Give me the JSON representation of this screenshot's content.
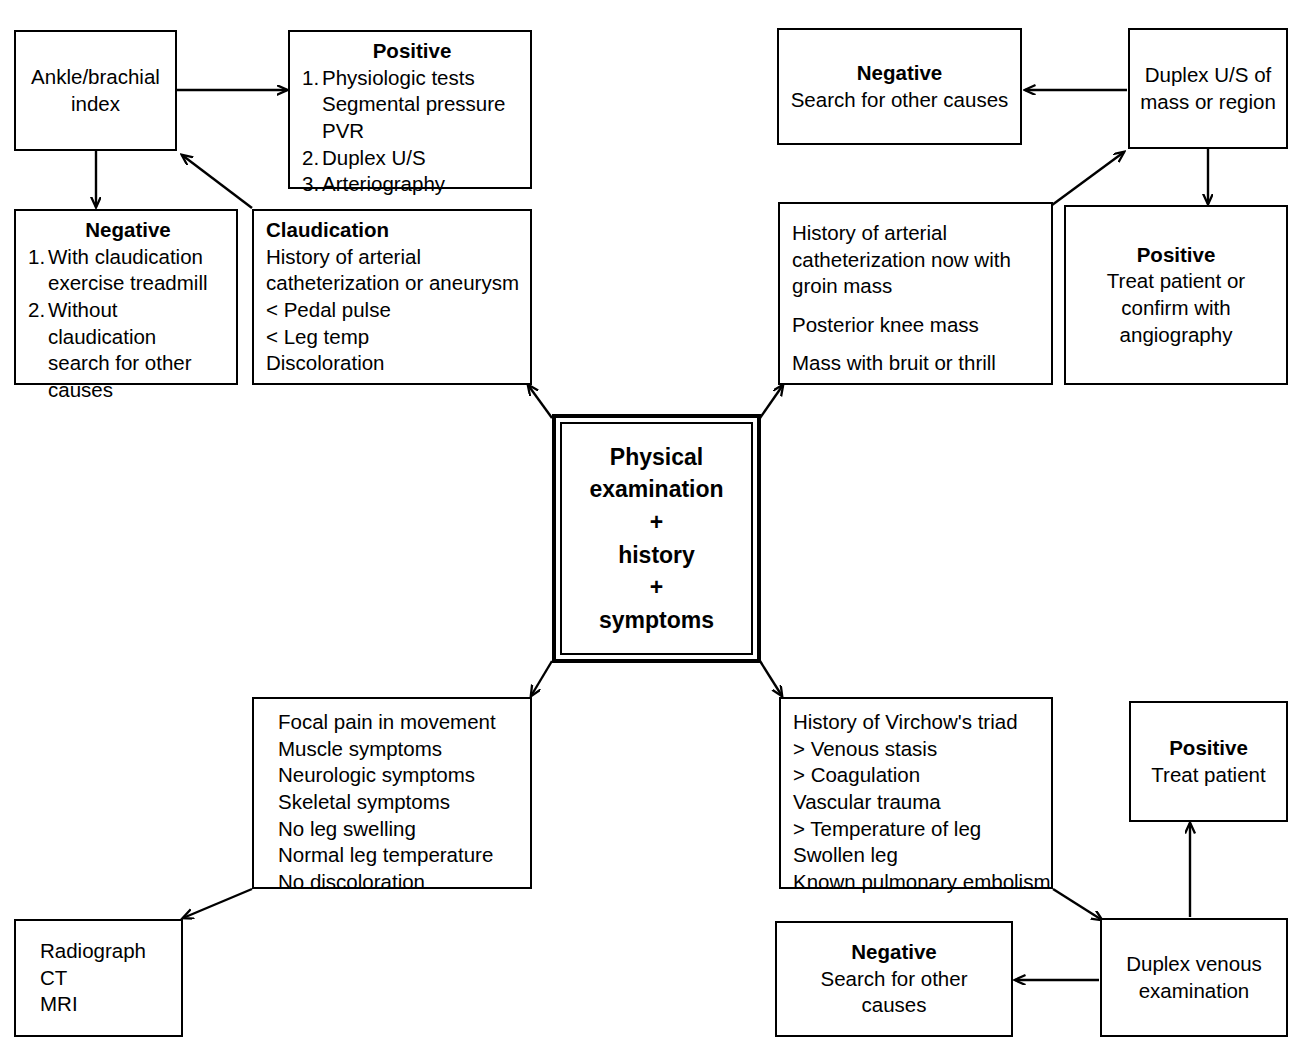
{
  "diagram": {
    "center": {
      "line1": "Physical",
      "line2": "examination",
      "plus1": "+",
      "line3": "history",
      "plus2": "+",
      "line4": "symptoms"
    },
    "nodes": {
      "ankle_brachial": {
        "line1": "Ankle/brachial",
        "line2": "index"
      },
      "positive_tests": {
        "title": "Positive",
        "item1_num": "1.",
        "item1_text": "Physiologic tests",
        "item1_sub1": "Segmental pressure",
        "item1_sub2": "PVR",
        "item2_num": "2.",
        "item2_text": "Duplex U/S",
        "item3_num": "3.",
        "item3_text": "Arteriography"
      },
      "negative_claudication": {
        "title": "Negative",
        "item1_num": "1.",
        "item1_text": "With claudication",
        "item1_sub": "exercise treadmill",
        "item2_num": "2.",
        "item2_text": "Without claudication",
        "item2_sub1": "search for other",
        "item2_sub2": "causes"
      },
      "claudication": {
        "title": "Claudication",
        "line1": "History of arterial",
        "line2": "catheterization or aneurysm",
        "line3": "< Pedal pulse",
        "line4": "< Leg temp",
        "line5": "Discoloration"
      },
      "negative_top_right": {
        "title": "Negative",
        "line1": "Search for other causes"
      },
      "duplex_us_mass": {
        "line1": "Duplex U/S of",
        "line2": "mass or region"
      },
      "arterial_cath_history": {
        "line1": "History of arterial",
        "line2": "catheterization now with",
        "line3": "groin mass",
        "line4": "Posterior knee mass",
        "line5": "Mass with bruit or thrill"
      },
      "positive_angiography": {
        "title": "Positive",
        "line1": "Treat patient or",
        "line2": "confirm with",
        "line3": "angiography"
      },
      "musculoskeletal_symptoms": {
        "line1": "Focal pain in movement",
        "line2": "Muscle symptoms",
        "line3": "Neurologic symptoms",
        "line4": "Skeletal symptoms",
        "line5": "No leg swelling",
        "line6": "Normal leg temperature",
        "line7": "No discoloration"
      },
      "radiograph": {
        "line1": "Radiograph",
        "line2": "CT",
        "line3": "MRI"
      },
      "virchow_triad": {
        "line1": "History of Virchow's triad",
        "line2": "> Venous stasis",
        "line3": "> Coagulation",
        "line4": "Vascular trauma",
        "line5": "> Temperature of leg",
        "line6": "Swollen leg",
        "line7": "Known pulmonary embolism"
      },
      "positive_treat": {
        "title": "Positive",
        "line1": "Treat patient"
      },
      "duplex_venous": {
        "line1": "Duplex venous",
        "line2": "examination"
      },
      "negative_bottom_right": {
        "title": "Negative",
        "line1": "Search for other",
        "line2": "causes"
      }
    },
    "colors": {
      "stroke": "#000000",
      "background": "#ffffff",
      "text": "#000000"
    }
  }
}
